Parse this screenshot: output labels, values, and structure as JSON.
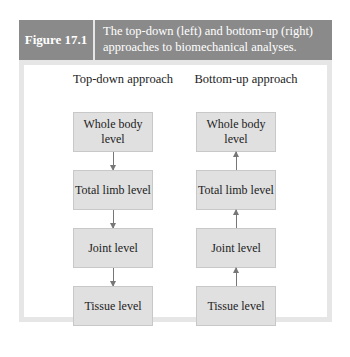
{
  "figure": {
    "label": "Figure 17.1",
    "caption": "The top-down (left) and bottom-up (right) approaches to biomechanical analyses."
  },
  "columns": [
    {
      "title": "Top-down approach",
      "direction": "down",
      "levels": [
        "Whole body level",
        "Total limb level",
        "Joint level",
        "Tissue level"
      ]
    },
    {
      "title": "Bottom-up approach",
      "direction": "up",
      "levels": [
        "Whole body level",
        "Total limb level",
        "Joint level",
        "Tissue level"
      ]
    }
  ],
  "colors": {
    "header_bg": "#8a8a8a",
    "frame_bg": "#e6e6e6",
    "box_bg": "#e0e0e0",
    "arrow": "#777777"
  }
}
